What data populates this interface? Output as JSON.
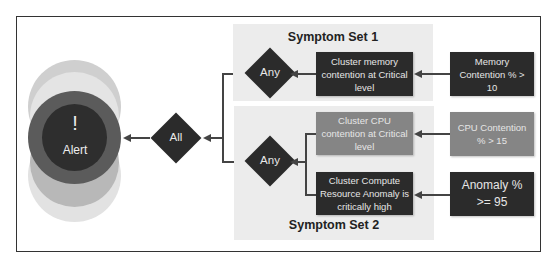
{
  "alert": {
    "icon": "!",
    "label": "Alert"
  },
  "gates": {
    "all": "All",
    "any1": "Any",
    "any2": "Any"
  },
  "symptom_sets": [
    {
      "title": "Symptom Set 1",
      "symptoms": [
        {
          "label": "Cluster memory contention at Critical level",
          "metric": "Memory Contention % > 10"
        }
      ]
    },
    {
      "title": "Symptom Set 2",
      "symptoms": [
        {
          "label": "Cluster CPU contention at Critical level",
          "metric": "CPU Contention % > 15"
        },
        {
          "label": "Cluster Compute Resource Anomaly is critically high",
          "metric": "Anomaly % >= 95"
        }
      ]
    }
  ],
  "colors": {
    "dark": "#2b2b2b",
    "mid": "#858585",
    "panel": "#ececec"
  }
}
